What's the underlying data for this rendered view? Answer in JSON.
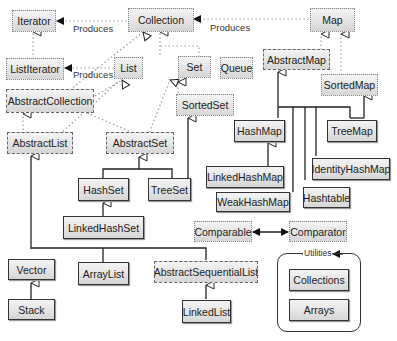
{
  "diagram": {
    "legend_styles": {
      "interface": "dotted",
      "abstract_class": "dashed",
      "concrete_class": "solid"
    },
    "nodes": {
      "iterator": "Iterator",
      "collection": "Collection",
      "map": "Map",
      "listiterator": "ListIterator",
      "list": "List",
      "set": "Set",
      "queue": "Queue",
      "abstractmap": "AbstractMap",
      "sortedmap": "SortedMap",
      "abstractcollection": "AbstractCollection",
      "sortedset": "SortedSet",
      "abstractlist": "AbstractList",
      "abstractset": "AbstractSet",
      "hashmap": "HashMap",
      "treemap": "TreeMap",
      "hashset": "HashSet",
      "treeset": "TreeSet",
      "linkedhashmap": "LinkedHashMap",
      "identityhashmap": "IdentityHashMap",
      "hashtable": "Hashtable",
      "weakhashmap": "WeakHashMap",
      "linkedhashset": "LinkedHashSet",
      "comparable": "Comparable",
      "comparator": "Comparator",
      "vector": "Vector",
      "arraylist": "ArrayList",
      "abstractsequentiallist": "AbstractSequentialList",
      "stack": "Stack",
      "linkedlist": "LinkedList",
      "collections": "Collections",
      "arrays": "Arrays"
    },
    "labels": {
      "produces1": "Produces",
      "produces2": "Produces",
      "produces3": "Produces",
      "utilities": "Utilities"
    }
  }
}
